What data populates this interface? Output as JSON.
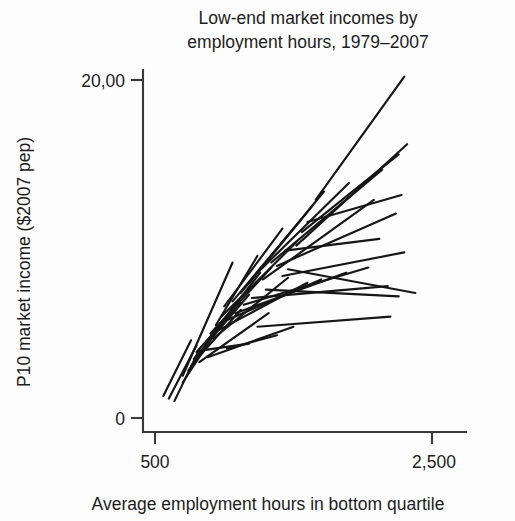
{
  "chart_data": {
    "type": "line",
    "title": "Low-end market incomes by employment hours, 1979–2007",
    "xlabel": "Average employment hours in bottom quartile",
    "ylabel": "P10 market income ($2007 pep)",
    "xlim": [
      500,
      2500
    ],
    "ylim": [
      0,
      20000
    ],
    "x_ticks": [
      500,
      2500
    ],
    "x_tick_labels": [
      "500",
      "2,500"
    ],
    "y_ticks": [
      0,
      20000
    ],
    "y_tick_labels": [
      "0",
      "20,00"
    ],
    "grid": false,
    "legend": null,
    "series": [
      {
        "name": "unit-01",
        "x": [
          560,
          760
        ],
        "y": [
          1300,
          4600
        ]
      },
      {
        "name": "unit-02",
        "x": [
          600,
          800
        ],
        "y": [
          1150,
          4300
        ]
      },
      {
        "name": "unit-03",
        "x": [
          640,
          820
        ],
        "y": [
          1000,
          4050
        ]
      },
      {
        "name": "unit-04",
        "x": [
          700,
          980
        ],
        "y": [
          2100,
          5600
        ]
      },
      {
        "name": "unit-05",
        "x": [
          700,
          1060
        ],
        "y": [
          2500,
          9200
        ]
      },
      {
        "name": "unit-06",
        "x": [
          740,
          1020
        ],
        "y": [
          2800,
          6000
        ]
      },
      {
        "name": "unit-07",
        "x": [
          760,
          1120
        ],
        "y": [
          3100,
          6400
        ]
      },
      {
        "name": "unit-08",
        "x": [
          780,
          1180
        ],
        "y": [
          3500,
          7300
        ]
      },
      {
        "name": "unit-09",
        "x": [
          800,
          1120
        ],
        "y": [
          3900,
          6800
        ]
      },
      {
        "name": "unit-10",
        "x": [
          820,
          1320
        ],
        "y": [
          3300,
          6200
        ]
      },
      {
        "name": "unit-11",
        "x": [
          860,
          1260
        ],
        "y": [
          4400,
          8600
        ]
      },
      {
        "name": "unit-12",
        "x": [
          880,
          1500
        ],
        "y": [
          3600,
          5400
        ]
      },
      {
        "name": "unit-13",
        "x": [
          900,
          1340
        ],
        "y": [
          5000,
          8900
        ]
      },
      {
        "name": "unit-14",
        "x": [
          920,
          1460
        ],
        "y": [
          4700,
          8300
        ]
      },
      {
        "name": "unit-15",
        "x": [
          940,
          1240
        ],
        "y": [
          5500,
          9600
        ]
      },
      {
        "name": "unit-16",
        "x": [
          960,
          1600
        ],
        "y": [
          5200,
          8000
        ]
      },
      {
        "name": "unit-17",
        "x": [
          980,
          1520
        ],
        "y": [
          6000,
          10400
        ]
      },
      {
        "name": "unit-18",
        "x": [
          1000,
          1420
        ],
        "y": [
          6600,
          11200
        ]
      },
      {
        "name": "unit-19",
        "x": [
          1020,
          1700
        ],
        "y": [
          5800,
          8200
        ]
      },
      {
        "name": "unit-20",
        "x": [
          1060,
          1560
        ],
        "y": [
          6900,
          11800
        ]
      },
      {
        "name": "unit-21",
        "x": [
          1080,
          1880
        ],
        "y": [
          6200,
          8600
        ]
      },
      {
        "name": "unit-22",
        "x": [
          1120,
          1640
        ],
        "y": [
          7400,
          12600
        ]
      },
      {
        "name": "unit-23",
        "x": [
          1140,
          2040
        ],
        "y": [
          6700,
          8900
        ]
      },
      {
        "name": "unit-24",
        "x": [
          1180,
          1720
        ],
        "y": [
          8000,
          13400
        ]
      },
      {
        "name": "unit-25",
        "x": [
          1200,
          2180
        ],
        "y": [
          7100,
          7800
        ]
      },
      {
        "name": "unit-26",
        "x": [
          1240,
          1900
        ],
        "y": [
          8600,
          13900
        ]
      },
      {
        "name": "unit-27",
        "x": [
          1280,
          2080
        ],
        "y": [
          8200,
          12900
        ]
      },
      {
        "name": "unit-28",
        "x": [
          1300,
          2260
        ],
        "y": [
          7600,
          7200
        ]
      },
      {
        "name": "unit-29",
        "x": [
          1340,
          2140
        ],
        "y": [
          9200,
          14700
        ]
      },
      {
        "name": "unit-30",
        "x": [
          1380,
          2240
        ],
        "y": [
          9000,
          12100
        ]
      },
      {
        "name": "unit-31",
        "x": [
          1420,
          2300
        ],
        "y": [
          8400,
          9800
        ]
      },
      {
        "name": "unit-32",
        "x": [
          1460,
          2380
        ],
        "y": [
          8800,
          7400
        ]
      },
      {
        "name": "unit-33",
        "x": [
          1520,
          2320
        ],
        "y": [
          10200,
          16200
        ]
      },
      {
        "name": "unit-34",
        "x": [
          1560,
          2260
        ],
        "y": [
          11000,
          15600
        ]
      },
      {
        "name": "unit-35",
        "x": [
          1600,
          2280
        ],
        "y": [
          11600,
          13200
        ]
      },
      {
        "name": "unit-36",
        "x": [
          1240,
          2200
        ],
        "y": [
          5400,
          6000
        ]
      },
      {
        "name": "unit-37",
        "x": [
          1660,
          2300
        ],
        "y": [
          12900,
          20200
        ]
      },
      {
        "name": "unit-38",
        "x": [
          1020,
          1380
        ],
        "y": [
          4100,
          4900
        ]
      },
      {
        "name": "unit-39",
        "x": [
          1440,
          2120
        ],
        "y": [
          9900,
          10600
        ]
      },
      {
        "name": "unit-40",
        "x": [
          840,
          1180
        ],
        "y": [
          4000,
          4400
        ]
      }
    ]
  },
  "figure": {
    "background_color": "#fdfdfd",
    "ink_color": "#161616",
    "axis_color": "#3a3a3a"
  }
}
